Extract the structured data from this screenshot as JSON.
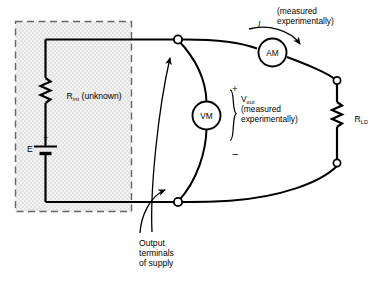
{
  "diagram": {
    "background_color": "#ffffff",
    "line_color": "#000000",
    "shade_color": "#e8e8e8",
    "dashed_border_color": "#5a5a5a"
  },
  "supply_box": {
    "label_internal_resistor": "R",
    "label_internal_resistor_sub": "int",
    "label_internal_resistor_note": " (unknown)",
    "label_emf": "E",
    "emf_polarity": "+"
  },
  "meters": {
    "ammeter": {
      "label": "AM",
      "name": "ammeter"
    },
    "voltmeter": {
      "label": "VM",
      "name": "voltmeter"
    }
  },
  "annotations": {
    "current_symbol": "I",
    "current_note_line1": "(measured",
    "current_note_line2": "experimentally)",
    "vout_symbol": "V",
    "vout_sub": "out",
    "vout_note_line1": "(measured",
    "vout_note_line2": "experimentally)",
    "polarity_plus": "+",
    "polarity_minus": "−",
    "output_caption_line1": "Output",
    "output_caption_line2": "terminals",
    "output_caption_line3": "of supply"
  },
  "load": {
    "label": "R",
    "label_sub": "LD"
  },
  "nodes": {
    "top_terminal": "output-terminal-top",
    "bottom_terminal": "output-terminal-bottom",
    "load_top_node": "load-top-node",
    "load_bottom_node": "load-bottom-node"
  }
}
